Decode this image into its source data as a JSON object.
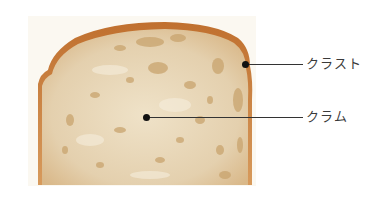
{
  "figure": {
    "labels": [
      {
        "id": "crust",
        "text": "クラスト"
      },
      {
        "id": "crumb",
        "text": "クラム"
      }
    ]
  },
  "colors": {
    "crust": "#c9783a",
    "crumb": "#e9d9bb",
    "background": "#fbf8f1",
    "leader": "#333333"
  }
}
